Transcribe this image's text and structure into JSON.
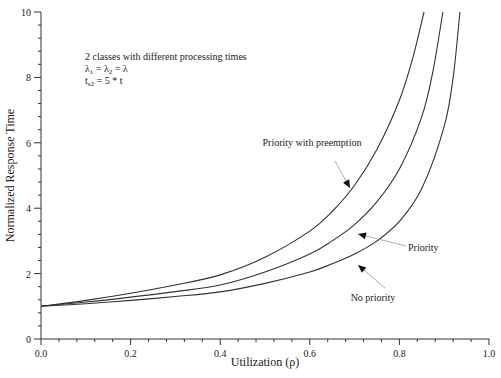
{
  "chart_data": {
    "type": "line",
    "title": "",
    "xlabel": "Utilization (ρ)",
    "ylabel": "Normalized Response Time",
    "xlim": [
      0,
      1
    ],
    "ylim": [
      0,
      10
    ],
    "x_ticks": [
      "0.0",
      "0.2",
      "0.4",
      "0.6",
      "0.8",
      "1.0"
    ],
    "y_ticks": [
      "0",
      "2",
      "4",
      "6",
      "8",
      "10"
    ],
    "grid": false,
    "legend": "none (inline arrow annotations)",
    "annotation_lines": [
      "2 classes with different processing times",
      "λ1 = λ2 = λ",
      "ts2 = 5 * t"
    ],
    "series": [
      {
        "name": "Priority with preemption",
        "x": [
          0.0,
          0.1,
          0.2,
          0.3,
          0.4,
          0.5,
          0.6,
          0.65,
          0.7,
          0.75,
          0.8,
          0.83,
          0.855
        ],
        "y": [
          1.0,
          1.18,
          1.4,
          1.65,
          1.96,
          2.5,
          3.3,
          3.9,
          4.7,
          5.8,
          7.3,
          8.6,
          10.0
        ]
      },
      {
        "name": "Priority",
        "x": [
          0.0,
          0.1,
          0.2,
          0.3,
          0.4,
          0.5,
          0.6,
          0.65,
          0.7,
          0.75,
          0.8,
          0.85,
          0.875,
          0.897
        ],
        "y": [
          1.0,
          1.13,
          1.28,
          1.45,
          1.65,
          2.05,
          2.6,
          3.0,
          3.5,
          4.2,
          5.2,
          6.8,
          8.2,
          10.0
        ]
      },
      {
        "name": "No priority",
        "x": [
          0.0,
          0.1,
          0.2,
          0.3,
          0.4,
          0.5,
          0.6,
          0.65,
          0.7,
          0.75,
          0.8,
          0.85,
          0.9,
          0.92,
          0.935
        ],
        "y": [
          1.0,
          1.08,
          1.18,
          1.3,
          1.44,
          1.7,
          2.05,
          2.3,
          2.6,
          3.0,
          3.6,
          4.6,
          6.5,
          8.0,
          10.0
        ]
      }
    ]
  },
  "labels": {
    "preemption": "Priority with preemption",
    "priority": "Priority",
    "no_priority": "No priority"
  }
}
